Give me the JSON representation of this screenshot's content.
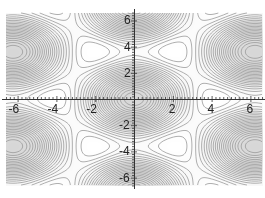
{
  "chart_data": {
    "type": "contour",
    "title": "",
    "xlabel": "",
    "ylabel": "",
    "xlim": [
      -6.6,
      6.6
    ],
    "ylim": [
      -6.6,
      6.6
    ],
    "x_ticks": [
      -6,
      -4,
      -2,
      2,
      4,
      6
    ],
    "y_ticks": [
      6,
      4,
      2,
      -2,
      -4,
      -6
    ],
    "x_tick_labels": [
      "-6",
      "-4",
      "-2",
      "2",
      "4",
      "6"
    ],
    "y_tick_labels": [
      "6",
      "4",
      "2",
      "-2",
      "-4",
      "-6"
    ],
    "minor_ticks_per_unit": 5,
    "grid": false,
    "legend": null,
    "axes_style": "crossing at origin",
    "field": {
      "form": "cos(k1·r) + cos(k2·r) + cos(k3·r)",
      "wave_vectors": [
        [
          1.0077,
          0
        ],
        [
          0.5038,
          0.8727
        ],
        [
          -0.5038,
          0.8727
        ]
      ],
      "y_scale": 1.0
    },
    "contour_levels": 24,
    "line_color": "#9a9a9a",
    "shade_color": "#d8d8d8"
  },
  "axes": {
    "pixel_origin": [
      134,
      99
    ],
    "px_per_unit_x": 19.4,
    "px_per_unit_y": 13.1
  }
}
